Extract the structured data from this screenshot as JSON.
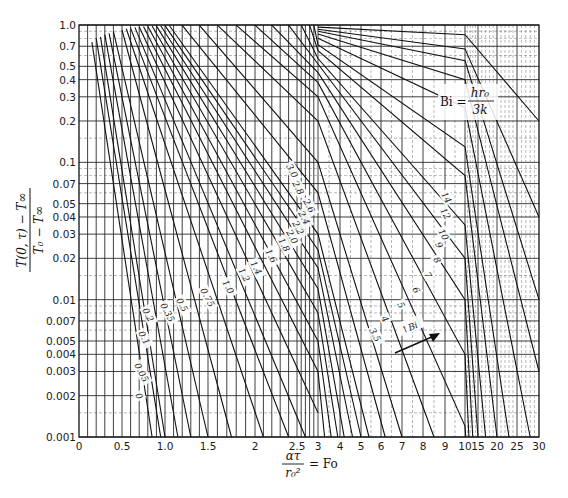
{
  "chart_data": {
    "type": "line",
    "title": "",
    "xlabel": "ατ / r₀² = Fo",
    "ylabel": "(T(0,τ) − T∞) / (T₀ − T∞)",
    "yscale": "log",
    "ylim": [
      0.001,
      1.0
    ],
    "xlim": [
      0,
      30
    ],
    "x_scale_note": "piecewise linear: 0–3, 3–10, 10–30",
    "grid": true,
    "x_ticks": [
      "0",
      "0.5",
      "1.0",
      "1.5",
      "2",
      "2.5",
      "3",
      "4",
      "5",
      "6",
      "7",
      "8",
      "9",
      "10",
      "15",
      "20",
      "25",
      "30"
    ],
    "y_ticks": [
      "0.001",
      "0.002",
      "0.003",
      "0.004",
      "0.005",
      "0.007",
      "0.01",
      "0.02",
      "0.03",
      "0.04",
      "0.05",
      "0.07",
      "0.1",
      "0.2",
      "0.3",
      "0.4",
      "0.5",
      "0.7",
      "1.0"
    ],
    "legend_annotation": "Bi = hr₀ / 3k",
    "arrow_annotation": "↑Bi",
    "series_labels": [
      "0",
      "0.05",
      "0.1",
      "0.2",
      "0.35",
      "0.5",
      "0.75",
      "1.0",
      "1.2",
      "1.4",
      "1.6",
      "1.8",
      "2.0",
      "2.2",
      "2.4",
      "2.6",
      "2.8",
      "3.0",
      "3.5",
      "4",
      "5",
      "6",
      "7",
      "8",
      "9",
      "10",
      "12",
      "14"
    ],
    "series": [
      {
        "name": "1/Bi = 0",
        "points": [
          [
            0.15,
            0.75
          ],
          [
            0.85,
            0.001
          ]
        ]
      },
      {
        "name": "1/Bi = 0.05",
        "points": [
          [
            0.2,
            0.8
          ],
          [
            0.95,
            0.001
          ]
        ]
      },
      {
        "name": "1/Bi = 0.1",
        "points": [
          [
            0.25,
            0.82
          ],
          [
            1.0,
            0.001
          ]
        ]
      },
      {
        "name": "1/Bi = 0.2",
        "points": [
          [
            0.3,
            0.85
          ],
          [
            1.15,
            0.001
          ]
        ]
      },
      {
        "name": "1/Bi = 0.35",
        "points": [
          [
            0.35,
            0.87
          ],
          [
            1.3,
            0.001
          ]
        ]
      },
      {
        "name": "1/Bi = 0.5",
        "points": [
          [
            0.4,
            0.9
          ],
          [
            1.5,
            0.001
          ]
        ]
      },
      {
        "name": "1/Bi = 0.75",
        "points": [
          [
            0.5,
            0.92
          ],
          [
            1.75,
            0.001
          ]
        ]
      },
      {
        "name": "1/Bi = 1.0",
        "points": [
          [
            0.55,
            0.94
          ],
          [
            2.1,
            0.001
          ]
        ]
      },
      {
        "name": "1/Bi = 1.2",
        "points": [
          [
            0.6,
            0.95
          ],
          [
            2.4,
            0.001
          ]
        ]
      },
      {
        "name": "1/Bi = 1.4",
        "points": [
          [
            0.65,
            0.96
          ],
          [
            2.7,
            0.001
          ]
        ]
      },
      {
        "name": "1/Bi = 1.6",
        "points": [
          [
            0.7,
            0.97
          ],
          [
            3.0,
            0.0015
          ]
        ]
      },
      {
        "name": "1/Bi = 1.8",
        "points": [
          [
            0.75,
            0.975
          ],
          [
            3.0,
            0.003
          ],
          [
            3.3,
            0.001
          ]
        ]
      },
      {
        "name": "1/Bi = 2.0",
        "points": [
          [
            0.8,
            0.98
          ],
          [
            3.0,
            0.005
          ],
          [
            3.6,
            0.001
          ]
        ]
      },
      {
        "name": "1/Bi = 2.2",
        "points": [
          [
            0.85,
            0.983
          ],
          [
            3.0,
            0.008
          ],
          [
            3.9,
            0.001
          ]
        ]
      },
      {
        "name": "1/Bi = 2.4",
        "points": [
          [
            0.9,
            0.985
          ],
          [
            3.0,
            0.012
          ],
          [
            4.2,
            0.001
          ]
        ]
      },
      {
        "name": "1/Bi = 2.6",
        "points": [
          [
            0.95,
            0.988
          ],
          [
            3.0,
            0.017
          ],
          [
            4.6,
            0.001
          ]
        ]
      },
      {
        "name": "1/Bi = 2.8",
        "points": [
          [
            1.0,
            0.99
          ],
          [
            3.0,
            0.023
          ],
          [
            5.0,
            0.001
          ]
        ]
      },
      {
        "name": "1/Bi = 3.0",
        "points": [
          [
            1.05,
            0.992
          ],
          [
            3.0,
            0.03
          ],
          [
            5.4,
            0.001
          ]
        ]
      },
      {
        "name": "1/Bi = 3.5",
        "points": [
          [
            1.2,
            0.994
          ],
          [
            3.0,
            0.06
          ],
          [
            6.2,
            0.001
          ]
        ]
      },
      {
        "name": "1/Bi = 4",
        "points": [
          [
            1.4,
            0.995
          ],
          [
            3.0,
            0.1
          ],
          [
            7.0,
            0.001
          ]
        ]
      },
      {
        "name": "1/Bi = 5",
        "points": [
          [
            1.6,
            0.996
          ],
          [
            3.0,
            0.2
          ],
          [
            8.5,
            0.001
          ]
        ]
      },
      {
        "name": "1/Bi = 6",
        "points": [
          [
            1.8,
            0.997
          ],
          [
            3.0,
            0.3
          ],
          [
            10.0,
            0.0012
          ],
          [
            10.3,
            0.001
          ]
        ]
      },
      {
        "name": "1/Bi = 7",
        "points": [
          [
            2.0,
            0.997
          ],
          [
            3.0,
            0.38
          ],
          [
            10.0,
            0.004
          ],
          [
            11.5,
            0.001
          ]
        ]
      },
      {
        "name": "1/Bi = 8",
        "points": [
          [
            2.2,
            0.998
          ],
          [
            3.0,
            0.45
          ],
          [
            10.0,
            0.01
          ],
          [
            13,
            0.001
          ]
        ]
      },
      {
        "name": "1/Bi = 9",
        "points": [
          [
            2.4,
            0.998
          ],
          [
            3.0,
            0.52
          ],
          [
            10.0,
            0.02
          ],
          [
            15,
            0.001
          ]
        ]
      },
      {
        "name": "1/Bi = 10",
        "points": [
          [
            2.6,
            0.998
          ],
          [
            3.0,
            0.57
          ],
          [
            10.0,
            0.035
          ],
          [
            17,
            0.001
          ]
        ]
      },
      {
        "name": "1/Bi = 12",
        "points": [
          [
            2.8,
            0.999
          ],
          [
            3.0,
            0.65
          ],
          [
            10.0,
            0.08
          ],
          [
            20,
            0.001
          ]
        ]
      },
      {
        "name": "1/Bi = 14",
        "points": [
          [
            2.9,
            0.999
          ],
          [
            3.0,
            0.72
          ],
          [
            10.0,
            0.13
          ],
          [
            23,
            0.001
          ]
        ]
      },
      {
        "name": "1/Bi = 18",
        "points": [
          [
            3.0,
            0.8
          ],
          [
            10.0,
            0.25
          ],
          [
            28,
            0.001
          ]
        ]
      },
      {
        "name": "1/Bi = 25",
        "points": [
          [
            3.0,
            0.86
          ],
          [
            10.0,
            0.4
          ],
          [
            30,
            0.003
          ]
        ]
      },
      {
        "name": "1/Bi = 35",
        "points": [
          [
            3.0,
            0.9
          ],
          [
            10.0,
            0.55
          ],
          [
            30,
            0.01
          ]
        ]
      },
      {
        "name": "1/Bi = 50",
        "points": [
          [
            3.0,
            0.93
          ],
          [
            10.0,
            0.67
          ],
          [
            30,
            0.04
          ]
        ]
      },
      {
        "name": "1/Bi = 100",
        "points": [
          [
            3.0,
            0.965
          ],
          [
            10.0,
            0.85
          ],
          [
            30,
            0.2
          ]
        ]
      }
    ]
  },
  "axes": {
    "x_title_numerator": "ατ",
    "x_title_denominator": "r₀²",
    "x_title_suffix": "= Fo",
    "y_title_numerator": "T(0, τ) − T∞",
    "y_title_denominator": "T₀ − T∞"
  },
  "annotations": {
    "bi_prefix": "Bi =",
    "bi_numerator": "hr₀",
    "bi_denominator": "3k",
    "arrow_label": "↑Bi"
  }
}
